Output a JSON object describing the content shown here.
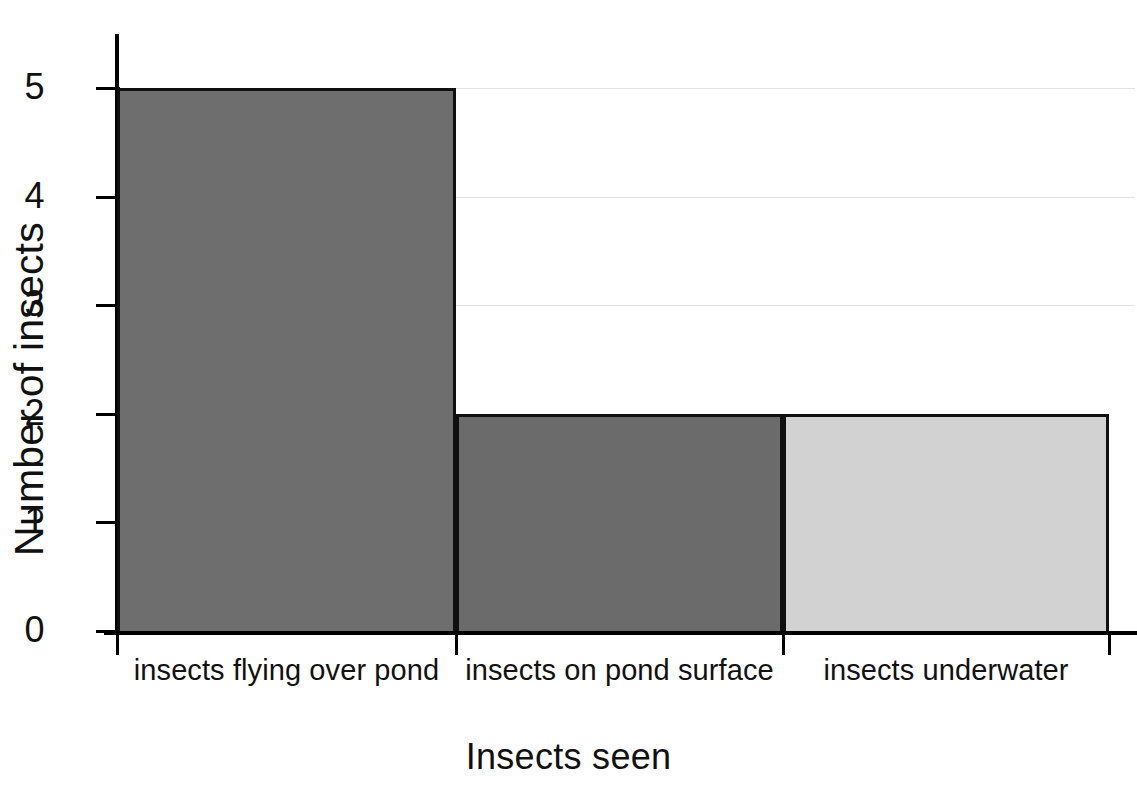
{
  "chart_data": {
    "type": "bar",
    "title": "",
    "xlabel": "Insects seen",
    "ylabel": "Number of insects",
    "categories": [
      "insects flying over pond",
      "insects on pond surface",
      "insects underwater"
    ],
    "values": [
      5,
      2,
      2
    ],
    "ylim": [
      0,
      5
    ],
    "ytick_labels": [
      "5",
      "4",
      "3",
      "2",
      "1",
      "0"
    ],
    "ytick_values": [
      5,
      4,
      3,
      2,
      1,
      0
    ],
    "grid": true,
    "gridlines_at": [
      5,
      4,
      3
    ],
    "legend": "none",
    "bar_colors": [
      "#6e6e6e",
      "#6b6b6b",
      "#d2d2d2"
    ],
    "bar_border_color": "#101010",
    "axis_color": "#000000",
    "gridline_color": "#e2e2e2",
    "background_color": "#ffffff"
  },
  "axes": {
    "y_title": "Number of insects",
    "x_title": "Insects seen"
  }
}
